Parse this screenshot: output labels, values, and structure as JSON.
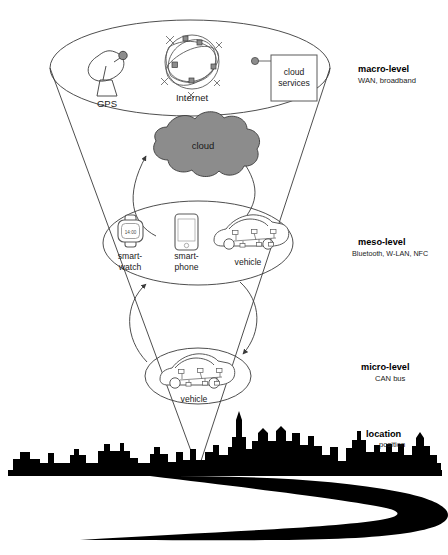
{
  "figure": {
    "background": "#ffffff",
    "stroke": "#3a3a3a",
    "cloud_fill": "#8c8c8c",
    "silhouette_fill": "#000000"
  },
  "levels": [
    {
      "id": "macro",
      "name": "macro-level",
      "technologies": "WAN, broadband",
      "label_x": 358,
      "label_y": 72
    },
    {
      "id": "meso",
      "name": "meso-level",
      "technologies": "Bluetooth, W-LAN, NFC",
      "label_x": 358,
      "label_y": 245
    },
    {
      "id": "micro",
      "name": "micro-level",
      "technologies": "CAN bus",
      "label_x": 358,
      "label_y": 370
    },
    {
      "id": "location",
      "name": "location",
      "technologies": "position",
      "label_x": 366,
      "label_y": 434
    }
  ],
  "nodes": {
    "macro": [
      {
        "id": "gps",
        "label": "GPS",
        "icon": "satellite-dish-icon"
      },
      {
        "id": "internet",
        "label": "Internet",
        "icon": "network-globe-icon"
      },
      {
        "id": "cloud-services",
        "label": "cloud services",
        "icon": "box-icon"
      }
    ],
    "cloud": {
      "id": "cloud",
      "label": "cloud",
      "icon": "cloud-icon"
    },
    "meso": [
      {
        "id": "smartwatch",
        "label_line1": "smart-",
        "label_line2": "watch",
        "icon": "smartwatch-icon",
        "watch_time": "14:00"
      },
      {
        "id": "smartphone",
        "label_line1": "smart-",
        "label_line2": "phone",
        "icon": "smartphone-icon"
      },
      {
        "id": "vehicle-meso",
        "label_line1": "vehicle",
        "label_line2": "",
        "icon": "car-network-icon"
      }
    ],
    "micro": [
      {
        "id": "vehicle-micro",
        "label": "vehicle",
        "icon": "car-network-icon"
      }
    ]
  },
  "connectors": [
    {
      "id": "cloud-to-meso",
      "from": "cloud",
      "to": "meso-ring",
      "style": "curved-arrow"
    },
    {
      "id": "meso-to-cloud",
      "from": "meso-ring",
      "to": "cloud",
      "style": "curved-arrow"
    },
    {
      "id": "meso-to-micro",
      "from": "meso-ring",
      "to": "micro-ring",
      "style": "curved-arrow"
    },
    {
      "id": "micro-to-meso",
      "from": "micro-ring",
      "to": "meso-ring",
      "style": "curved-arrow"
    }
  ]
}
